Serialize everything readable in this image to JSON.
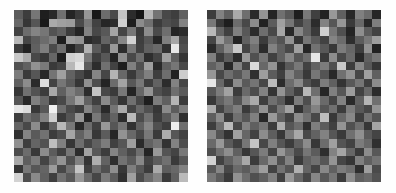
{
  "figure": {
    "background_color": "#fefefe",
    "panel_count": 2,
    "colormap": "gray",
    "cell_size_px": 8.7
  },
  "chart_data": [
    {
      "type": "heatmap",
      "name": "left-noise-matrix",
      "title": "",
      "xlabel": "",
      "ylabel": "",
      "colormap": "gray",
      "vmin": 0,
      "vmax": 255,
      "grid": false,
      "legend": "none",
      "rows": 20,
      "cols": 20,
      "x": [
        0,
        1,
        2,
        3,
        4,
        5,
        6,
        7,
        8,
        9,
        10,
        11,
        12,
        13,
        14,
        15,
        16,
        17,
        18,
        19
      ],
      "y": [
        0,
        1,
        2,
        3,
        4,
        5,
        6,
        7,
        8,
        9,
        10,
        11,
        12,
        13,
        14,
        15,
        16,
        17,
        18,
        19
      ],
      "values": [
        [
          92,
          61,
          118,
          30,
          42,
          112,
          36,
          58,
          150,
          24,
          108,
          74,
          196,
          44,
          22,
          182,
          116,
          72,
          62,
          96
        ],
        [
          104,
          54,
          86,
          26,
          170,
          160,
          156,
          74,
          120,
          66,
          38,
          44,
          208,
          30,
          140,
          112,
          60,
          78,
          70,
          130
        ],
        [
          66,
          108,
          132,
          118,
          82,
          96,
          60,
          36,
          130,
          72,
          88,
          164,
          68,
          118,
          58,
          140,
          74,
          110,
          36,
          44
        ],
        [
          184,
          70,
          92,
          108,
          126,
          30,
          156,
          146,
          42,
          52,
          100,
          78,
          134,
          210,
          62,
          86,
          38,
          128,
          166,
          72
        ],
        [
          60,
          34,
          96,
          126,
          74,
          110,
          36,
          68,
          178,
          90,
          58,
          154,
          44,
          120,
          64,
          96,
          106,
          50,
          232,
          80
        ],
        [
          200,
          170,
          72,
          56,
          102,
          30,
          208,
          216,
          120,
          62,
          88,
          36,
          142,
          72,
          110,
          46,
          68,
          160,
          96,
          54
        ],
        [
          80,
          96,
          146,
          122,
          58,
          70,
          184,
          230,
          92,
          44,
          112,
          66,
          30,
          128,
          80,
          158,
          42,
          96,
          118,
          74
        ],
        [
          124,
          58,
          86,
          40,
          116,
          160,
          98,
          72,
          50,
          134,
          70,
          180,
          104,
          58,
          96,
          128,
          62,
          110,
          34,
          204
        ],
        [
          96,
          140,
          42,
          220,
          66,
          118,
          90,
          54,
          144,
          78,
          36,
          108,
          164,
          88,
          120,
          62,
          98,
          44,
          130,
          70
        ],
        [
          54,
          112,
          82,
          60,
          168,
          96,
          130,
          108,
          44,
          196,
          72,
          58,
          120,
          36,
          102,
          148,
          80,
          66,
          110,
          90
        ],
        [
          86,
          40,
          128,
          102,
          56,
          72,
          118,
          160,
          98,
          64,
          138,
          90,
          52,
          112,
          70,
          30,
          124,
          96,
          180,
          58
        ],
        [
          230,
          218,
          56,
          88,
          240,
          110,
          74,
          60,
          132,
          96,
          42,
          116,
          170,
          68,
          104,
          80,
          54,
          138,
          92,
          124
        ],
        [
          62,
          110,
          92,
          128,
          206,
          58,
          84,
          150,
          36,
          120,
          68,
          98,
          44,
          186,
          76,
          112,
          60,
          90,
          128,
          46
        ],
        [
          100,
          72,
          140,
          54,
          96,
          184,
          120,
          40,
          108,
          64,
          152,
          86,
          118,
          50,
          96,
          134,
          80,
          62,
          238,
          110
        ],
        [
          48,
          132,
          90,
          114,
          60,
          78,
          166,
          98,
          128,
          56,
          92,
          38,
          146,
          104,
          72,
          120,
          58,
          172,
          86,
          66
        ],
        [
          144,
          62,
          100,
          82,
          190,
          128,
          54,
          110,
          70,
          96,
          124,
          64,
          86,
          158,
          42,
          98,
          116,
          50,
          130,
          78
        ],
        [
          76,
          108,
          56,
          140,
          92,
          64,
          118,
          44,
          162,
          88,
          60,
          132,
          96,
          72,
          110,
          36,
          152,
          84,
          68,
          120
        ],
        [
          168,
          94,
          122,
          68,
          110,
          148,
          80,
          128,
          52,
          174,
          98,
          46,
          114,
          90,
          136,
          68,
          92,
          112,
          58,
          86
        ],
        [
          52,
          120,
          86,
          100,
          156,
          72,
          112,
          196,
          64,
          108,
          80,
          142,
          56,
          126,
          88,
          60,
          170,
          94,
          104,
          130
        ],
        [
          210,
          78,
          138,
          96,
          62,
          114,
          88,
          150,
          106,
          70,
          124,
          92,
          48,
          160,
          76,
          108,
          134,
          58,
          96,
          186
        ]
      ]
    },
    {
      "type": "heatmap",
      "name": "right-noise-matrix",
      "title": "",
      "xlabel": "",
      "ylabel": "",
      "colormap": "gray",
      "vmin": 0,
      "vmax": 255,
      "grid": false,
      "legend": "none",
      "rows": 20,
      "cols": 20,
      "x": [
        0,
        1,
        2,
        3,
        4,
        5,
        6,
        7,
        8,
        9,
        10,
        11,
        12,
        13,
        14,
        15,
        16,
        17,
        18,
        19
      ],
      "y": [
        0,
        1,
        2,
        3,
        4,
        5,
        6,
        7,
        8,
        9,
        10,
        11,
        12,
        13,
        14,
        15,
        16,
        17,
        18,
        19
      ],
      "values": [
        [
          60,
          130,
          96,
          170,
          110,
          42,
          148,
          36,
          112,
          88,
          30,
          120,
          64,
          34,
          152,
          96,
          40,
          128,
          108,
          38
        ],
        [
          120,
          56,
          30,
          108,
          72,
          140,
          34,
          92,
          160,
          118,
          66,
          96,
          44,
          130,
          86,
          150,
          58,
          104,
          40,
          126
        ],
        [
          184,
          100,
          64,
          128,
          88,
          44,
          110,
          72,
          166,
          40,
          134,
          96,
          58,
          208,
          118,
          80,
          36,
          142,
          92,
          66
        ],
        [
          70,
          154,
          112,
          36,
          96,
          128,
          60,
          104,
          84,
          146,
          52,
          118,
          90,
          66,
          132,
          108,
          46,
          92,
          120,
          158
        ],
        [
          42,
          96,
          136,
          200,
          68,
          112,
          44,
          130,
          96,
          72,
          160,
          38,
          114,
          88,
          56,
          124,
          102,
          62,
          146,
          34
        ],
        [
          128,
          60,
          92,
          44,
          152,
          80,
          118,
          64,
          96,
          134,
          86,
          110,
          230,
          58,
          142,
          72,
          106,
          40,
          96,
          118
        ],
        [
          96,
          118,
          40,
          130,
          68,
          218,
          104,
          148,
          52,
          90,
          120,
          66,
          98,
          124,
          80,
          200,
          60,
          136,
          88,
          54
        ],
        [
          150,
          72,
          110,
          86,
          120,
          48,
          158,
          92,
          64,
          132,
          96,
          56,
          118,
          84,
          40,
          112,
          146,
          70,
          160,
          96
        ],
        [
          230,
          104,
          56,
          140,
          90,
          116,
          70,
          186,
          44,
          108,
          138,
          82,
          60,
          124,
          96,
          52,
          88,
          118,
          64,
          140
        ],
        [
          88,
          124,
          162,
          60,
          106,
          76,
          130,
          52,
          148,
          96,
          64,
          184,
          110,
          38,
          128,
          86,
          156,
          66,
          104,
          44
        ],
        [
          56,
          98,
          120,
          84,
          136,
          170,
          62,
          112,
          90,
          46,
          124,
          78,
          152,
          106,
          68,
          130,
          42,
          96,
          180,
          112
        ],
        [
          172,
          68,
          104,
          126,
          58,
          92,
          146,
          74,
          118,
          162,
          50,
          96,
          130,
          86,
          112,
          60,
          124,
          88,
          70,
          148
        ],
        [
          94,
          140,
          60,
          112,
          86,
          128,
          40,
          154,
          98,
          66,
          140,
          114,
          72,
          190,
          56,
          104,
          136,
          62,
          116,
          84
        ],
        [
          62,
          108,
          186,
          72,
          130,
          96,
          118,
          60,
          174,
          86,
          108,
          46,
          126,
          92,
          64,
          148,
          80,
          110,
          54,
          164
        ],
        [
          136,
          84,
          50,
          160,
          102,
          66,
          140,
          94,
          56,
          122,
          168,
          72,
          98,
          130,
          86,
          58,
          112,
          144,
          90,
          68
        ],
        [
          106,
          152,
          90,
          64,
          118,
          196,
          72,
          128,
          86,
          60,
          96,
          140,
          56,
          108,
          160,
          84,
          66,
          124,
          104,
          48
        ],
        [
          78,
          112,
          142,
          96,
          54,
          86,
          124,
          68,
          150,
          110,
          74,
          118,
          92,
          46,
          130,
          164,
          102,
          58,
          140,
          88
        ],
        [
          210,
          66,
          98,
          122,
          168,
          60,
          104,
          144,
          80,
          130,
          58,
          96,
          112,
          86,
          148,
          70,
          54,
          128,
          96,
          116
        ],
        [
          88,
          134,
          72,
          106,
          92,
          120,
          158,
          66,
          114,
          84,
          176,
          100,
          68,
          136,
          96,
          124,
          110,
          46,
          158,
          74
        ],
        [
          120,
          92,
          58,
          146,
          110,
          80,
          96,
          128,
          64,
          152,
          104,
          70,
          134,
          88,
          118,
          60,
          142,
          96,
          106,
          82
        ]
      ]
    }
  ]
}
